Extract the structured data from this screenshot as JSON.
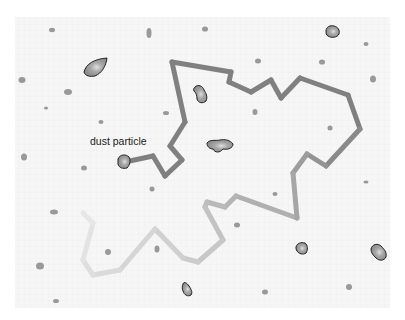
{
  "diagram": {
    "background_color": "#f6f6f6",
    "grid_color": "#ececec",
    "panel": {
      "x": 15,
      "y": 17,
      "w": 375,
      "h": 291
    },
    "label": {
      "text": "dust particle",
      "x": 90,
      "y": 135
    },
    "path": {
      "color_dark": "#808080",
      "color_light": "#e4e4e4",
      "width": 5,
      "points_dark": [
        [
          125,
          162
        ],
        [
          153,
          156
        ],
        [
          165,
          176
        ],
        [
          182,
          160
        ],
        [
          170,
          146
        ],
        [
          185,
          122
        ],
        [
          172,
          62
        ],
        [
          231,
          72
        ],
        [
          229,
          82
        ],
        [
          251,
          92
        ],
        [
          271,
          80
        ],
        [
          281,
          98
        ],
        [
          300,
          78
        ],
        [
          348,
          95
        ],
        [
          360,
          129
        ],
        [
          326,
          166
        ],
        [
          307,
          154
        ],
        [
          293,
          173
        ],
        [
          297,
          218
        ]
      ],
      "points_light": [
        [
          297,
          218
        ],
        [
          236,
          196
        ],
        [
          225,
          207
        ],
        [
          207,
          202
        ],
        [
          205,
          207
        ],
        [
          223,
          240
        ],
        [
          198,
          262
        ],
        [
          183,
          258
        ],
        [
          155,
          229
        ],
        [
          120,
          270
        ],
        [
          93,
          275
        ],
        [
          83,
          260
        ],
        [
          93,
          223
        ],
        [
          83,
          213
        ]
      ]
    },
    "large_particles": [
      {
        "name": "particle-top-left",
        "cx": 96,
        "cy": 68,
        "d": "M84,72 C86,64 94,59 107,58 C106,66 102,73 95,76 C90,77 85,76 84,72 Z"
      },
      {
        "name": "particle-top-right",
        "cx": 332,
        "cy": 32,
        "d": "M326,31 C326,27 330,25 334,26 C338,27 340,30 339,34 C337,38 331,38 328,36 C326,35 326,33 326,31 Z"
      },
      {
        "name": "particle-center-top",
        "cx": 201,
        "cy": 93,
        "d": "M195,87 C198,84 203,86 204,90 C206,93 208,97 206,101 C203,104 198,103 197,99 C197,95 196,93 194,91 C193,89 194,88 195,87 Z"
      },
      {
        "name": "particle-dust",
        "cx": 124,
        "cy": 162,
        "d": "M118,159 C120,154 126,154 129,157 C131,160 130,165 127,168 C123,169 119,168 118,164 Z"
      },
      {
        "name": "particle-center",
        "cx": 216,
        "cy": 146,
        "d": "M207,143 C210,139 216,141 220,140 C225,139 230,140 233,144 C233,148 228,150 223,149 C220,153 215,153 213,149 C210,149 207,147 207,143 Z"
      },
      {
        "name": "particle-lower-right-mid",
        "cx": 302,
        "cy": 248,
        "d": "M296,247 C297,243 301,242 305,243 C308,245 308,250 306,253 C303,255 299,254 297,251 C296,250 296,248 296,247 Z"
      },
      {
        "name": "particle-lower-right",
        "cx": 379,
        "cy": 253,
        "d": "M371,249 C372,244 378,243 381,246 C384,249 387,252 386,257 C384,261 379,261 376,258 C373,255 371,253 371,249 Z"
      },
      {
        "name": "particle-bottom",
        "cx": 186,
        "cy": 290,
        "d": "M183,284 C184,281 187,283 189,286 C191,289 193,292 191,295 C188,297 184,295 183,291 C182,289 182,286 183,284 Z"
      }
    ],
    "small_particles": [
      [
        52,
        30,
        3,
        2.2
      ],
      [
        149,
        33,
        2.5,
        5
      ],
      [
        205,
        29,
        3,
        2.6
      ],
      [
        366,
        44,
        2.5,
        2
      ],
      [
        22,
        80,
        3.5,
        3
      ],
      [
        68,
        92,
        4,
        3
      ],
      [
        101,
        122,
        2.5,
        2
      ],
      [
        258,
        61,
        3,
        2.5
      ],
      [
        322,
        62,
        3,
        2.6
      ],
      [
        373,
        79,
        3,
        3.5
      ],
      [
        46,
        108,
        2,
        1.5
      ],
      [
        166,
        113,
        3,
        2
      ],
      [
        255,
        112,
        2.5,
        3
      ],
      [
        330,
        128,
        2.5,
        2.5
      ],
      [
        24,
        157,
        3,
        3.5
      ],
      [
        84,
        168,
        3,
        2.5
      ],
      [
        152,
        189,
        2.5,
        2.5
      ],
      [
        54,
        212,
        4,
        2.5
      ],
      [
        237,
        225,
        3,
        2.5
      ],
      [
        275,
        194,
        2.5,
        2
      ],
      [
        366,
        182,
        2.5,
        1.5
      ],
      [
        40,
        266,
        4,
        3.5
      ],
      [
        108,
        252,
        3,
        3
      ],
      [
        157,
        249,
        2.5,
        3.5
      ],
      [
        56,
        301,
        3,
        2
      ],
      [
        265,
        292,
        3,
        2.5
      ],
      [
        349,
        287,
        3,
        3
      ]
    ]
  }
}
